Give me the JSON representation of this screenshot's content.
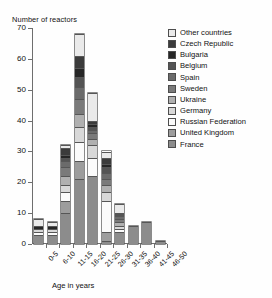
{
  "chart_data": {
    "type": "bar",
    "stacked": true,
    "title": "",
    "ylabel": "Number of reactors",
    "xlabel": "Age in years",
    "ylim": [
      0,
      70
    ],
    "yticks": [
      0,
      10,
      20,
      30,
      40,
      50,
      60,
      70
    ],
    "grid": false,
    "legend_position": "right",
    "categories": [
      "0-5",
      "6-10",
      "11-15",
      "16-20",
      "21-25",
      "26-30",
      "31-35",
      "36-40",
      "41-45",
      "46-50"
    ],
    "totals": [
      8,
      7,
      32,
      68,
      49,
      28,
      12,
      6,
      7,
      1
    ],
    "series": [
      {
        "name": "France",
        "color": "#8c8c8c",
        "values": [
          3,
          3,
          10,
          21,
          22,
          1,
          4,
          6,
          7,
          1
        ]
      },
      {
        "name": "United Kingdom",
        "color": "#9d9d9d",
        "values": [
          0,
          0,
          4,
          6,
          0,
          3,
          0,
          0,
          0,
          0
        ]
      },
      {
        "name": "Russian Federation",
        "color": "#fbfbfb",
        "values": [
          1,
          1,
          3,
          6,
          6,
          10,
          1,
          0,
          0,
          0
        ]
      },
      {
        "name": "Germany",
        "color": "#d8d8d8",
        "values": [
          1,
          1,
          2,
          5,
          4,
          3,
          1,
          0,
          0,
          0
        ]
      },
      {
        "name": "Ukraine",
        "color": "#b0b0b0",
        "values": [
          0,
          0,
          3,
          4,
          2,
          2,
          1,
          0,
          0,
          0
        ]
      },
      {
        "name": "Sweden",
        "color": "#7a7a7a",
        "values": [
          0,
          0,
          3,
          5,
          2,
          2,
          1,
          0,
          0,
          0
        ]
      },
      {
        "name": "Spain",
        "color": "#6b6b6b",
        "values": [
          0,
          0,
          2,
          4,
          1,
          2,
          1,
          0,
          0,
          0
        ]
      },
      {
        "name": "Belgium",
        "color": "#545454",
        "values": [
          0,
          0,
          1,
          3,
          1,
          2,
          1,
          0,
          0,
          0
        ]
      },
      {
        "name": "Bulgaria",
        "color": "#262626",
        "values": [
          1,
          1,
          1,
          3,
          1,
          1,
          0,
          0,
          0,
          0
        ]
      },
      {
        "name": "Czech Republic",
        "color": "#3b3b3b",
        "values": [
          0,
          0,
          2,
          4,
          1,
          2,
          0,
          0,
          0,
          0
        ]
      },
      {
        "name": "Other countries",
        "color": "#eaeaea",
        "values": [
          2,
          1,
          1,
          7,
          9,
          2,
          3,
          0,
          0,
          0
        ]
      }
    ]
  },
  "legend": {
    "items": [
      {
        "label": "Other countries",
        "color": "#eaeaea"
      },
      {
        "label": "Czech Republic",
        "color": "#3b3b3b"
      },
      {
        "label": "Bulgaria",
        "color": "#262626"
      },
      {
        "label": "Belgium",
        "color": "#545454"
      },
      {
        "label": "Spain",
        "color": "#6b6b6b"
      },
      {
        "label": "Sweden",
        "color": "#7a7a7a"
      },
      {
        "label": "Ukraine",
        "color": "#b0b0b0"
      },
      {
        "label": "Germany",
        "color": "#d8d8d8"
      },
      {
        "label": "Russian Federation",
        "color": "#fbfbfb"
      },
      {
        "label": "United Kingdom",
        "color": "#9d9d9d"
      },
      {
        "label": "France",
        "color": "#8c8c8c"
      }
    ]
  }
}
